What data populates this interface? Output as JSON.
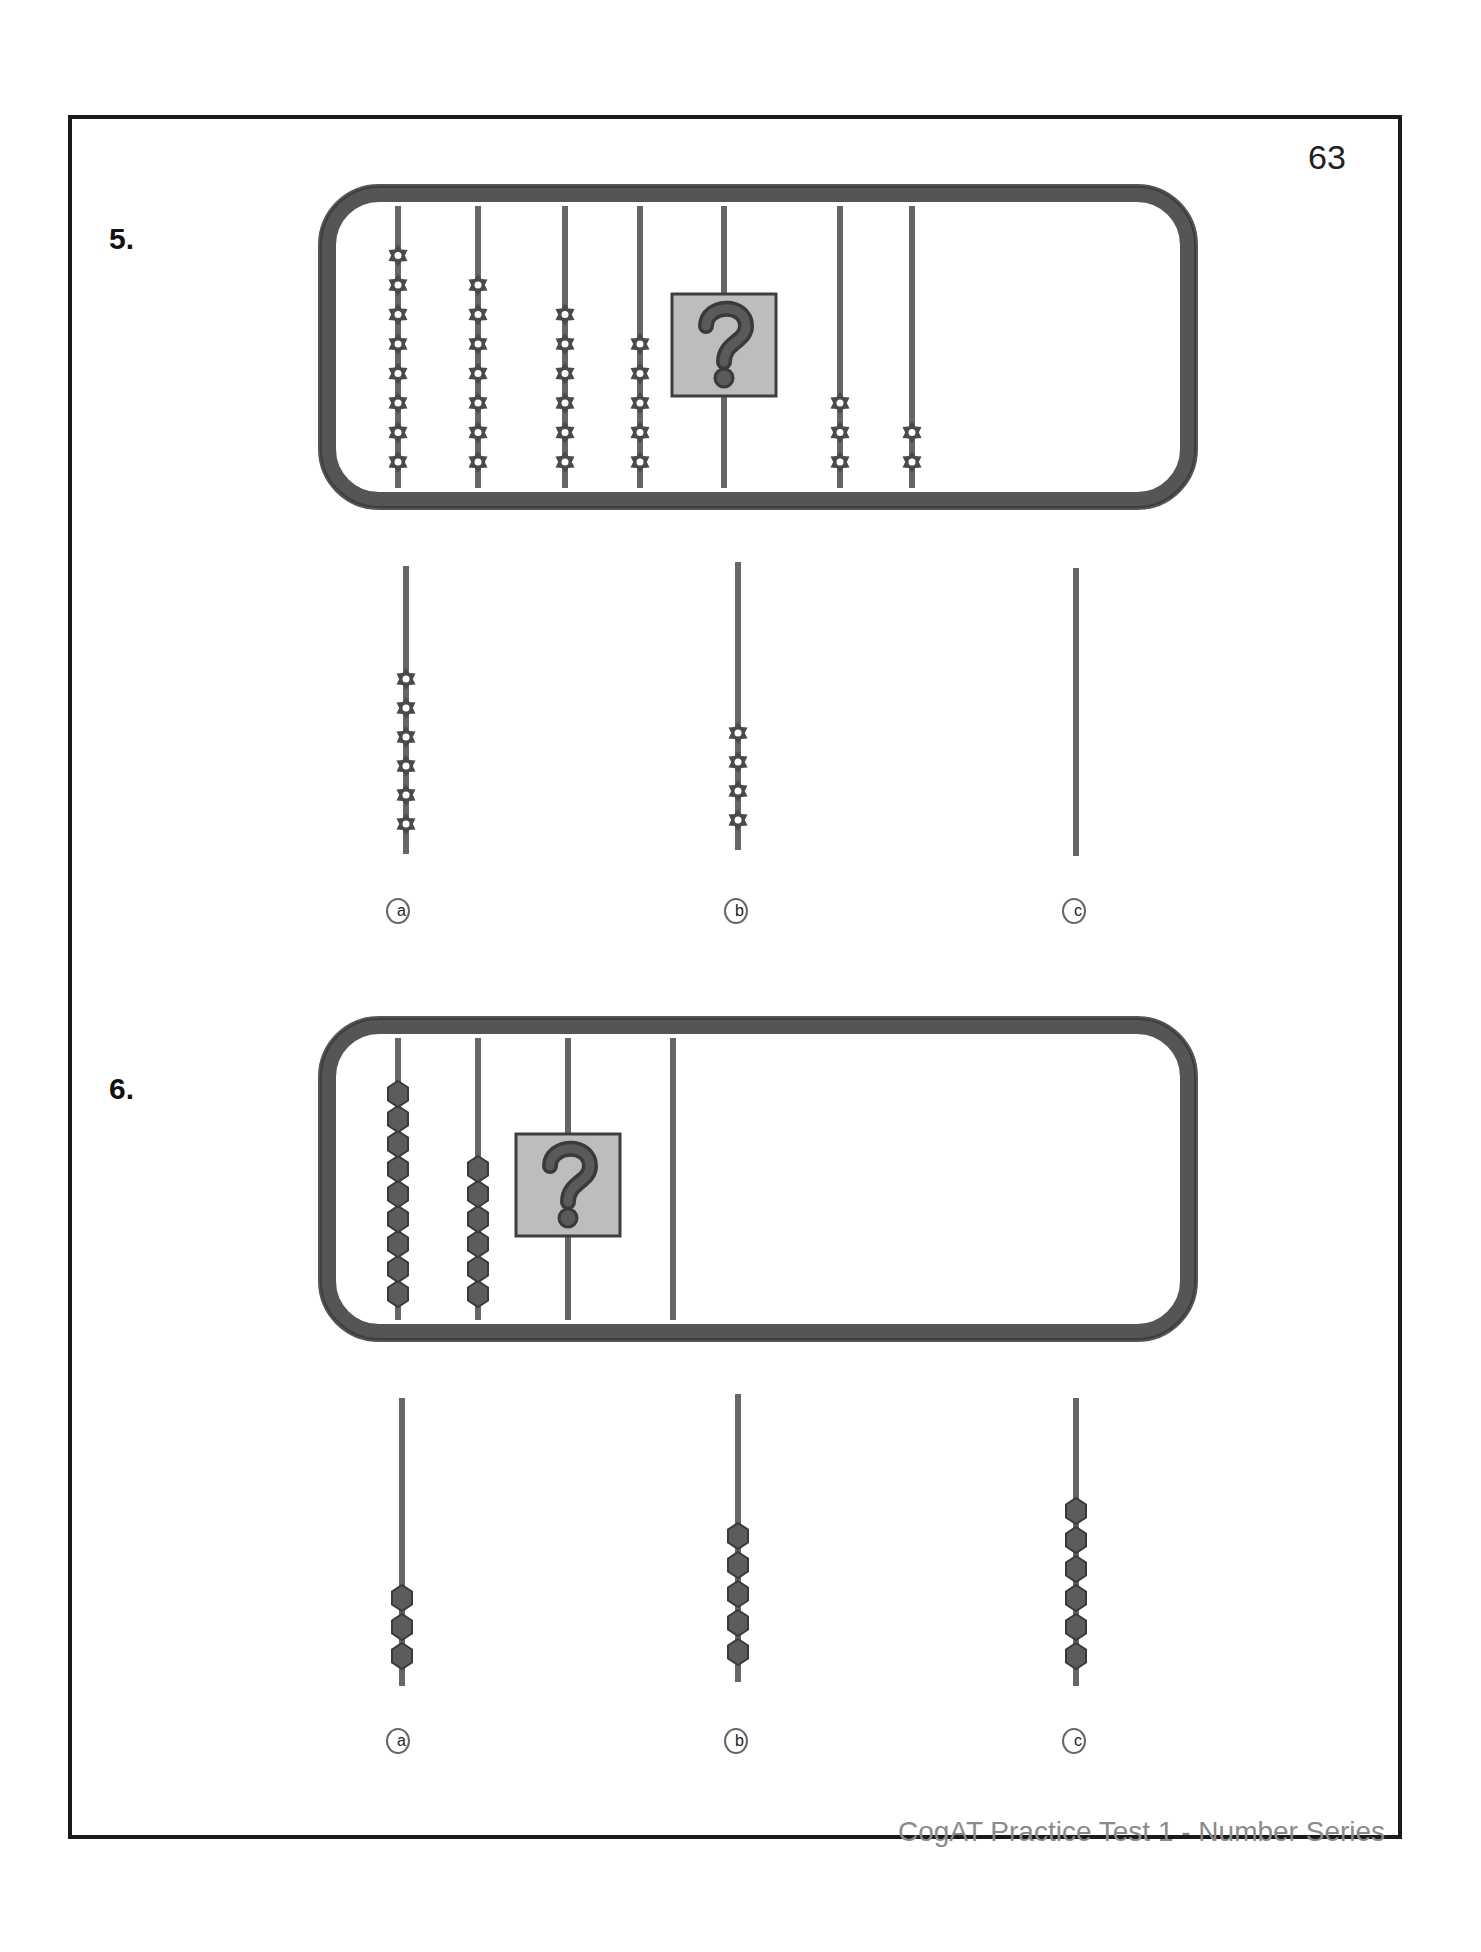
{
  "page": {
    "number": "63",
    "footer": "CogAT Practice Test 1 - Number Series"
  },
  "colors": {
    "frame": "#555555",
    "frame_dark": "#3e3e3e",
    "rod": "#666666",
    "bead": "#4a4a4a",
    "question_box": "#bdbdbd",
    "question_mark": "#5a5a5a"
  },
  "questions": [
    {
      "label": "5.",
      "bead_shape": "star",
      "frame_rods": [
        {
          "beads": 8
        },
        {
          "beads": 7
        },
        {
          "beads": 6
        },
        {
          "beads": 5
        },
        {
          "beads": null,
          "unknown": true,
          "question_icon": "question-mark-icon"
        },
        {
          "beads": 3
        },
        {
          "beads": 2
        }
      ],
      "choices": [
        {
          "label": "a",
          "beads": 6
        },
        {
          "label": "b",
          "beads": 4
        },
        {
          "label": "c",
          "beads": 0
        }
      ]
    },
    {
      "label": "6.",
      "bead_shape": "hexagon",
      "frame_rods": [
        {
          "beads": 9
        },
        {
          "beads": 6
        },
        {
          "beads": null,
          "unknown": true,
          "question_icon": "question-mark-icon"
        },
        {
          "beads": 0
        }
      ],
      "choices": [
        {
          "label": "a",
          "beads": 3
        },
        {
          "label": "b",
          "beads": 5
        },
        {
          "label": "c",
          "beads": 6
        }
      ]
    }
  ]
}
